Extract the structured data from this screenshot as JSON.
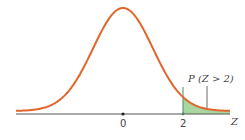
{
  "chart_data": {
    "type": "area",
    "title": "",
    "xlabel": "Z",
    "ylabel": "",
    "x_ticks": [
      0,
      2
    ],
    "x_tick_labels": [
      "0",
      "2"
    ],
    "xlim": [
      -3.5,
      3.6
    ],
    "grid": false,
    "legend": null,
    "series": [
      {
        "name": "Standard normal density",
        "distribution": "N(0,1)",
        "color": "#e0662c"
      }
    ],
    "shaded_region": {
      "from": 2,
      "to": "inf",
      "color": "#a8d5a0",
      "edge_color": "#4a8a6a",
      "label": "P (Z > 2)"
    },
    "annotations": [
      {
        "text": "P (Z > 2)",
        "points_to": "shaded right tail"
      }
    ]
  },
  "labels": {
    "tick_0": "0",
    "tick_2": "2",
    "axis_var": "Z",
    "area_label": "P (Z > 2)"
  },
  "colors": {
    "curve": "#e0662c",
    "shade": "#a8d5a0",
    "axis": "#555555",
    "divider": "#4a8a6a"
  }
}
